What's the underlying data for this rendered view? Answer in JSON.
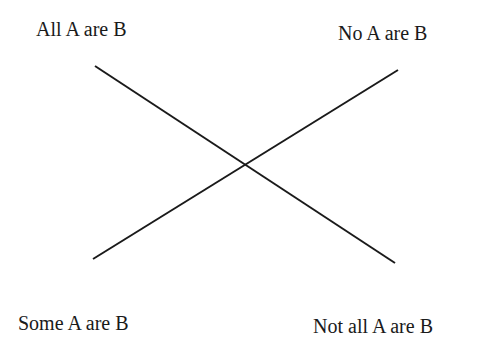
{
  "diagram": {
    "type": "square-of-opposition",
    "corners": {
      "top_left": "All A are B",
      "top_right": "No A are B",
      "bottom_left": "Some A are B",
      "bottom_right": "Not all A are B"
    },
    "line_color": "#1a1a1a"
  }
}
